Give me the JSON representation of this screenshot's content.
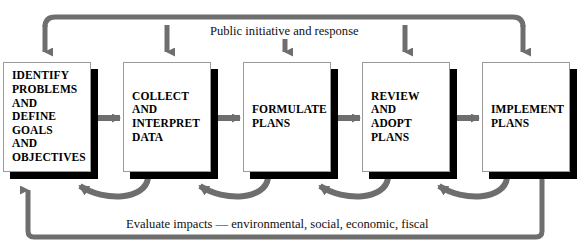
{
  "diagram": {
    "title_top": "Public initiative and response",
    "title_bottom": "Evaluate impacts — environmental, social, economic, fiscal",
    "colors": {
      "arrow_gray": "#6e6e6e",
      "box_border": "#9a9a9a",
      "shadow": "#000000",
      "text": "#000000",
      "background": "#ffffff"
    },
    "nodes": [
      {
        "id": "identify",
        "label": "IDENTIFY\nPROBLEMS\nAND\nDEFINE\nGOALS\nAND\nOBJECTIVES"
      },
      {
        "id": "collect",
        "label": "COLLECT\nAND\nINTERPRET\nDATA"
      },
      {
        "id": "formulate",
        "label": "FORMULATE\nPLANS"
      },
      {
        "id": "review",
        "label": "REVIEW\nAND\nADOPT\nPLANS"
      },
      {
        "id": "implement",
        "label": "IMPLEMENT\nPLANS"
      }
    ]
  }
}
